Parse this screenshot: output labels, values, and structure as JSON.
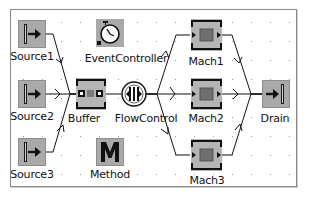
{
  "diagram": {
    "nodes": [
      {
        "id": "source1",
        "label": "Source1",
        "type": "source"
      },
      {
        "id": "source2",
        "label": "Source2",
        "type": "source"
      },
      {
        "id": "source3",
        "label": "Source3",
        "type": "source"
      },
      {
        "id": "eventcontroller",
        "label": "EventController",
        "type": "event-controller"
      },
      {
        "id": "buffer",
        "label": "Buffer",
        "type": "buffer"
      },
      {
        "id": "method",
        "label": "Method",
        "type": "method"
      },
      {
        "id": "flowcontrol",
        "label": "FlowControl",
        "type": "flow-control"
      },
      {
        "id": "mach1",
        "label": "Mach1",
        "type": "single-proc"
      },
      {
        "id": "mach2",
        "label": "Mach2",
        "type": "single-proc"
      },
      {
        "id": "mach3",
        "label": "Mach3",
        "type": "single-proc"
      },
      {
        "id": "drain",
        "label": "Drain",
        "type": "drain"
      }
    ],
    "edges": [
      {
        "from": "source1",
        "to": "buffer"
      },
      {
        "from": "source2",
        "to": "buffer"
      },
      {
        "from": "source3",
        "to": "buffer"
      },
      {
        "from": "buffer",
        "to": "flowcontrol"
      },
      {
        "from": "flowcontrol",
        "to": "mach1"
      },
      {
        "from": "flowcontrol",
        "to": "mach2"
      },
      {
        "from": "flowcontrol",
        "to": "mach3"
      },
      {
        "from": "mach1",
        "to": "drain"
      },
      {
        "from": "mach2",
        "to": "drain"
      },
      {
        "from": "mach3",
        "to": "drain"
      }
    ],
    "colors": {
      "icon_fill": "#a9a9a9",
      "icon_dark": "#1a1a1a",
      "machine_inner": "#6f6f6f",
      "connector": "#111111",
      "grid_dot": "#9a9a9a",
      "frame_border": "#8a8a8a"
    }
  }
}
